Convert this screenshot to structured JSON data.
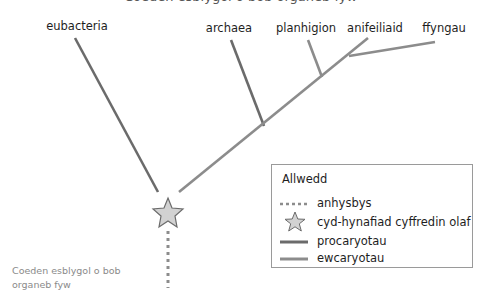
{
  "title_cut_text": "Coeden esblygol o bob organeb fyw",
  "tree": {
    "leaves": [
      {
        "id": "eubacteria",
        "label": "eubacteria",
        "group": "procaryotau"
      },
      {
        "id": "archaea",
        "label": "archaea",
        "group": "procaryotau"
      },
      {
        "id": "planhigion",
        "label": "planhigion",
        "group": "ewcaryotau"
      },
      {
        "id": "anifeiliaid",
        "label": "anifeiliaid",
        "group": "ewcaryotau"
      },
      {
        "id": "ffyngau",
        "label": "ffyngau",
        "group": "ewcaryotau"
      }
    ],
    "root_marker": "cyd-hynafiad cyffredin olaf"
  },
  "colors": {
    "procaryotau": "#6b6b6b",
    "ewcaryotau": "#8c8c8c",
    "anhysbys": "#8c8c8c",
    "star_fill": "#d2d2d2",
    "star_stroke": "#6b6b6b"
  },
  "legend": {
    "title": "Allwedd",
    "items": [
      {
        "label": "anhysbys",
        "symbol": "dotted-line-icon"
      },
      {
        "label": "cyd-hynafiad cyffredin olaf",
        "symbol": "star-icon"
      },
      {
        "label": "procaryotau",
        "symbol": "dark-line-icon"
      },
      {
        "label": "ewcaryotau",
        "symbol": "light-line-icon"
      }
    ]
  },
  "caption": {
    "line1": "Coeden esblygol o bob",
    "line2": "organeb fyw"
  }
}
